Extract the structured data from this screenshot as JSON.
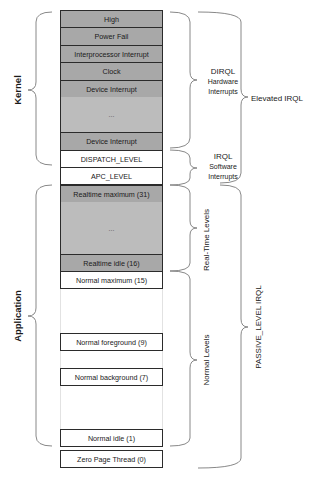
{
  "diagram": {
    "left_groups": {
      "kernel": "Kernel",
      "application": "Application"
    },
    "levels": [
      {
        "label": "High",
        "style": "gray"
      },
      {
        "label": "Power Fail",
        "style": "gray"
      },
      {
        "label": "Interprocessor Interrupt",
        "style": "gray"
      },
      {
        "label": "Clock",
        "style": "gray"
      },
      {
        "label": "Device Interrupt",
        "style": "gray"
      },
      {
        "label": "...",
        "style": "gray-filler"
      },
      {
        "label": "Device Interrupt",
        "style": "gray"
      },
      {
        "label": "DISPATCH_LEVEL",
        "style": "white"
      },
      {
        "label": "APC_LEVEL",
        "style": "white"
      },
      {
        "label": "Realtime maximum (31)",
        "style": "gray"
      },
      {
        "label": "...",
        "style": "gray-filler"
      },
      {
        "label": "Realtime idle (16)",
        "style": "gray"
      },
      {
        "label": "Normal maximum (15)",
        "style": "white"
      },
      {
        "label": "Normal foreground  (9)",
        "style": "white"
      },
      {
        "label": "Normal background  (7)",
        "style": "white"
      },
      {
        "label": "Normal idle (1)",
        "style": "white"
      },
      {
        "label": "Zero Page Thread (0)",
        "style": "white"
      }
    ],
    "right_groups": {
      "dirql": {
        "title": "DIRQL",
        "line1": "Hardware",
        "line2": "Interrupts"
      },
      "irql_sw": {
        "title": "IRQL",
        "line1": "Software",
        "line2": "Interrupts"
      },
      "elevated": "Elevated IRQL",
      "realtime": "Real-Time Levels",
      "normal": "Normal Levels",
      "passive": "PASSIVE_LEVEL IRQL"
    },
    "colors": {
      "gray_row": "#a8a8a8",
      "gray_filler": "#bcbcbc",
      "border": "#2b2b2b",
      "brace": "#777777"
    }
  }
}
